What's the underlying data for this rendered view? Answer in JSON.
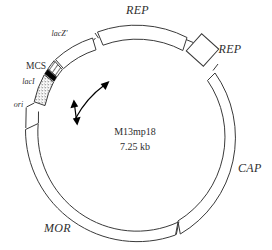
{
  "figure": {
    "type": "plasmid-map",
    "name": "M13mp18 vector map",
    "center": {
      "vector_name": "M13mp18",
      "size": "7.25 kb"
    },
    "colors": {
      "line": "#3a3a3a",
      "fill": "#ffffff",
      "solid_feature": "#000000",
      "background": "#ffffff"
    },
    "labels": {
      "rep_top": "REP",
      "rep_right": "REP",
      "cap": "CAP",
      "mor": "MOR",
      "lacz": "lacZ'",
      "mcs": "MCS",
      "laci": "lacI",
      "ori": "ori"
    },
    "features": [
      {
        "key": "rep_top",
        "label": "REP",
        "style": "outer-arc-box",
        "italic": true
      },
      {
        "key": "rep_right",
        "label": "REP",
        "style": "diamond-box",
        "italic": true
      },
      {
        "key": "cap",
        "label": "CAP",
        "style": "arc-box",
        "italic": true
      },
      {
        "key": "mor",
        "label": "MOR",
        "style": "arc-box",
        "italic": true
      },
      {
        "key": "lacz",
        "label": "lacZ'",
        "style": "arc-box",
        "italic": true
      },
      {
        "key": "mcs",
        "label": "MCS",
        "style": "hatched-box",
        "italic": false
      },
      {
        "key": "laci",
        "label": "lacI",
        "style": "solid-black-band",
        "italic": true
      },
      {
        "key": "ori",
        "label": "ori",
        "style": "stippled-box",
        "italic": true
      }
    ],
    "annotations": [
      {
        "key": "curved-arrow",
        "name": "transcription-direction-arrow",
        "description": "curved arrow pointing up-right"
      },
      {
        "key": "double-arrow",
        "name": "double-headed-arrow",
        "description": "short vertical double-headed arrow"
      }
    ]
  }
}
